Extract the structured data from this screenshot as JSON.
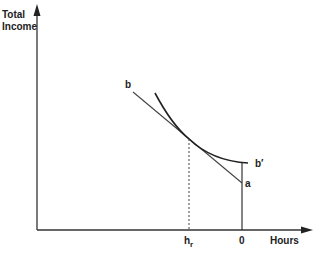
{
  "diagram": {
    "y_axis_label_line1": "Total",
    "y_axis_label_line2": "Income",
    "x_axis_label": "Hours",
    "label_b": "b",
    "label_b_prime": "b′",
    "label_a": "a",
    "label_hr_main": "h",
    "label_hr_sub": "r",
    "label_zero": "0",
    "colors": {
      "line": "#333333",
      "curve": "#222222",
      "background": "#ffffff"
    }
  }
}
